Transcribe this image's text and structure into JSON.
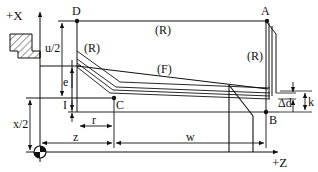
{
  "diagram": {
    "axes": {
      "x_axis_label": "+X",
      "z_axis_label": "+Z"
    },
    "points": {
      "A": "A",
      "B": "B",
      "C": "C",
      "D": "D"
    },
    "path_labels": {
      "rapid_top": "(R)",
      "rapid_left": "(R)",
      "rapid_right": "(R)",
      "feed": "(F)"
    },
    "dimensions": {
      "u_half": "u/2",
      "e": "e",
      "i": "I",
      "x_half": "x/2",
      "r": "r",
      "z": "z",
      "w": "w",
      "delta_d": "Δd",
      "k": "k"
    },
    "colors": {
      "stroke": "#111111",
      "background": "#ffffff"
    }
  }
}
